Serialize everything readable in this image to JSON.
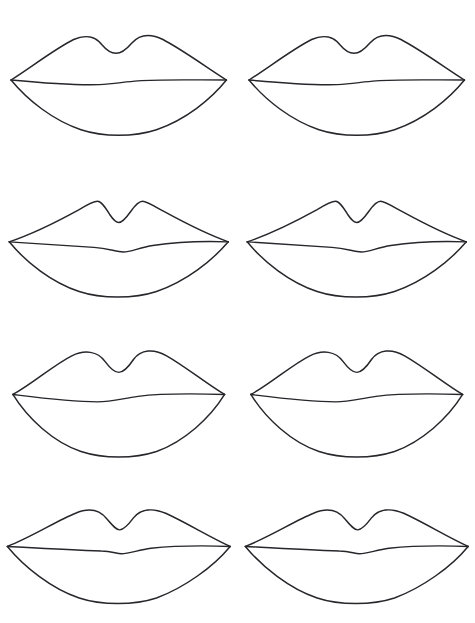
{
  "page": {
    "background_color": "#ffffff",
    "ink_color": "#26262b",
    "columns": 2,
    "rows": 4,
    "total_drawings": 8,
    "width": 475,
    "height": 623
  },
  "drawings": [
    {
      "id": 1,
      "row": 1,
      "column": 1,
      "label": "Lips study 1",
      "style": "soft rounded cupid's bow, medium fullness",
      "upper": "M 12 80 C 34 66 60 46 80 36 C 93 30 104 33 111 42 C 116 48 121 51 126 51 C 132 51 137 47 143 40 C 151 31 163 29 177 36 C 198 47 224 66 246 80",
      "mouthline": "M 12 80 C 44 83 76 86 108 85 C 124 84 136 82 150 81 C 172 79 210 80 246 80",
      "lower": "M 12 80 C 30 102 58 124 88 134 C 112 142 146 142 170 134 C 202 123 229 101 246 80",
      "viewbox": "0 0 258 160"
    },
    {
      "id": 2,
      "row": 1,
      "column": 2,
      "label": "Lips study 2",
      "style": "soft rounded cupid's bow, medium fullness",
      "upper": "M 12 80 C 34 66 60 46 80 36 C 93 30 104 33 111 42 C 116 48 121 51 126 51 C 132 51 137 47 143 40 C 151 31 163 29 177 36 C 198 47 224 66 246 80",
      "mouthline": "M 12 80 C 44 83 76 86 108 85 C 124 84 136 82 150 81 C 172 79 210 80 246 80",
      "lower": "M 12 80 C 30 102 58 124 88 134 C 112 142 146 142 170 134 C 202 123 229 101 246 80",
      "viewbox": "0 0 258 160"
    },
    {
      "id": 3,
      "row": 2,
      "column": 1,
      "label": "Lips study 3",
      "style": "sharp angular cupid's bow peaks, thinner upper lip, wavy mouth line",
      "upper": "M 10 82 C 34 74 66 58 86 47 C 96 41 103 38 106 38 C 110 38 114 44 119 52 C 123 58 126 61 129 61 C 133 61 137 56 142 49 C 147 42 151 38 155 38 C 159 38 167 43 178 49 C 200 61 228 75 248 82",
      "mouthline": "M 10 82 C 44 84 74 86 102 88 C 118 89 126 93 134 93 C 142 93 152 88 166 86 C 192 82 222 81 248 82",
      "lower": "M 10 82 C 28 104 56 126 86 136 C 110 144 146 144 170 136 C 202 125 230 103 248 82",
      "viewbox": "0 0 258 160"
    },
    {
      "id": 4,
      "row": 2,
      "column": 2,
      "label": "Lips study 4",
      "style": "sharp angular cupid's bow peaks, thinner upper lip, wavy mouth line",
      "upper": "M 10 82 C 34 74 66 58 86 47 C 96 41 103 38 106 38 C 110 38 114 44 119 52 C 123 58 126 61 129 61 C 133 61 137 56 142 49 C 147 42 151 38 155 38 C 159 38 167 43 178 49 C 200 61 228 75 248 82",
      "mouthline": "M 10 82 C 44 84 74 86 102 88 C 118 89 126 93 134 93 C 142 93 152 88 166 86 C 192 82 222 81 248 82",
      "lower": "M 10 82 C 28 104 56 126 86 136 C 110 144 146 144 170 136 C 202 125 230 103 248 82",
      "viewbox": "0 0 258 160"
    },
    {
      "id": 5,
      "row": 3,
      "column": 1,
      "label": "Lips study 5",
      "style": "fullest rounded lobes, widest lower lip",
      "upper": "M 14 74 C 36 62 58 42 78 32 C 92 25 106 27 114 38 C 120 46 124 50 129 50 C 134 50 139 45 145 36 C 153 25 167 24 181 32 C 202 44 224 62 244 74",
      "mouthline": "M 14 74 C 46 78 76 82 106 82 C 122 82 134 78 150 76 C 174 73 212 73 244 74",
      "lower": "M 14 74 C 30 100 58 126 88 136 C 112 144 146 144 170 136 C 200 125 228 100 244 74",
      "viewbox": "0 0 258 160"
    },
    {
      "id": 6,
      "row": 3,
      "column": 2,
      "label": "Lips study 6",
      "style": "fullest rounded lobes, widest lower lip",
      "upper": "M 14 74 C 36 62 58 42 78 32 C 92 25 106 27 114 38 C 120 46 124 50 129 50 C 134 50 139 45 145 36 C 153 25 167 24 181 32 C 202 44 224 62 244 74",
      "mouthline": "M 14 74 C 46 78 76 82 106 82 C 122 82 134 78 150 76 C 174 73 212 73 244 74",
      "lower": "M 14 74 C 30 100 58 126 88 136 C 112 144 146 144 170 136 C 200 125 228 100 244 74",
      "viewbox": "0 0 258 160"
    },
    {
      "id": 7,
      "row": 4,
      "column": 1,
      "label": "Lips study 7",
      "style": "widest and flattest, shallow cupid's bow",
      "upper": "M 8 66 C 34 56 62 38 82 30 C 96 24 108 26 116 36 C 122 43 126 48 130 48 C 134 48 139 43 145 35 C 153 25 166 24 180 30 C 202 40 228 56 250 66",
      "mouthline": "M 8 66 C 44 68 78 70 110 71 C 122 71 126 74 132 74 C 140 74 150 70 164 68 C 192 65 224 65 250 66",
      "lower": "M 8 66 C 26 88 56 112 86 122 C 110 130 146 130 170 122 C 200 111 232 88 250 66",
      "viewbox": "0 0 258 143"
    },
    {
      "id": 8,
      "row": 4,
      "column": 2,
      "label": "Lips study 8",
      "style": "widest and flattest, shallow cupid's bow",
      "upper": "M 8 66 C 34 56 62 38 82 30 C 96 24 108 26 116 36 C 122 43 126 48 130 48 C 134 48 139 43 145 35 C 153 25 166 24 180 30 C 202 40 228 56 250 66",
      "mouthline": "M 8 66 C 44 68 78 70 110 71 C 122 71 126 74 132 74 C 140 74 150 70 164 68 C 192 65 224 65 250 66",
      "lower": "M 8 66 C 26 88 56 112 86 122 C 110 130 146 130 170 122 C 200 111 232 88 250 66",
      "viewbox": "0 0 258 143"
    }
  ]
}
